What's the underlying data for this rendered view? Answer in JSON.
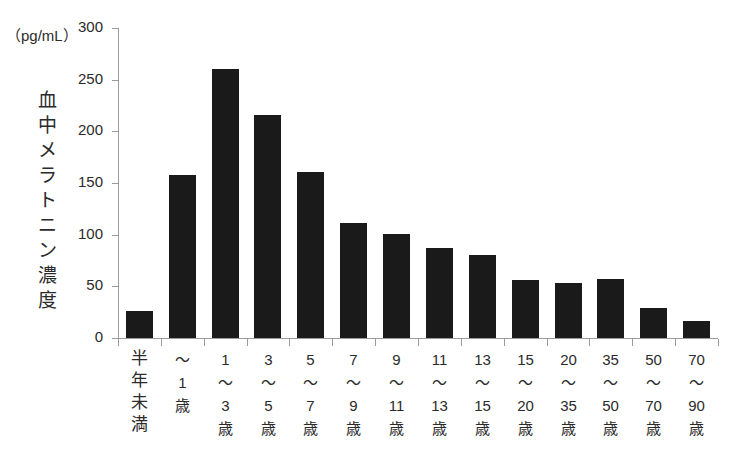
{
  "chart_data": {
    "type": "bar",
    "title": "",
    "subtitle": "",
    "unit_label": "（pg/mL）",
    "ylabel": "血中メラトニン濃度",
    "xlabel": "",
    "ylim": [
      0,
      300
    ],
    "ytick_values": [
      300,
      250,
      200,
      150,
      100,
      50,
      0
    ],
    "ytick_labels": [
      "300",
      "250",
      "200",
      "150",
      "100",
      "50",
      "0"
    ],
    "grid": false,
    "legend": "none",
    "bar_color": "#1a1a1a",
    "axis_color": "#9b9b9b",
    "categories": [
      "半年未満",
      "〜1歳",
      "1〜3歳",
      "3〜5歳",
      "5〜7歳",
      "7〜9歳",
      "9〜11歳",
      "11〜13歳",
      "13〜15歳",
      "15〜20歳",
      "20〜35歳",
      "35〜50歳",
      "50〜70歳",
      "70〜90歳"
    ],
    "category_label_lines": [
      [
        "半",
        "年",
        "未",
        "満"
      ],
      [
        "〜",
        "1",
        "歳"
      ],
      [
        "1",
        "〜",
        "3",
        "歳"
      ],
      [
        "3",
        "〜",
        "5",
        "歳"
      ],
      [
        "5",
        "〜",
        "7",
        "歳"
      ],
      [
        "7",
        "〜",
        "9",
        "歳"
      ],
      [
        "9",
        "〜",
        "11",
        "歳"
      ],
      [
        "11",
        "〜",
        "13",
        "歳"
      ],
      [
        "13",
        "〜",
        "15",
        "歳"
      ],
      [
        "15",
        "〜",
        "20",
        "歳"
      ],
      [
        "20",
        "〜",
        "35",
        "歳"
      ],
      [
        "35",
        "〜",
        "50",
        "歳"
      ],
      [
        "50",
        "〜",
        "70",
        "歳"
      ],
      [
        "70",
        "〜",
        "90",
        "歳"
      ]
    ],
    "values": [
      26,
      158,
      260,
      216,
      161,
      111,
      101,
      87,
      80,
      56,
      53,
      57,
      29,
      16
    ]
  }
}
